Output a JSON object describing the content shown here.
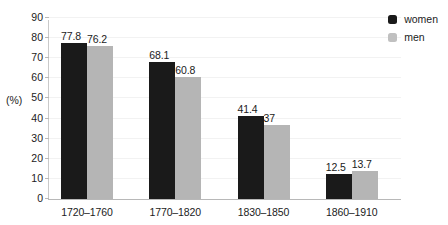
{
  "chart_data": {
    "type": "bar",
    "title": "",
    "subtitle": "",
    "xlabel": "",
    "ylabel": "(%)",
    "ylim": [
      0,
      90
    ],
    "yticks": [
      0,
      10,
      20,
      30,
      40,
      50,
      60,
      70,
      80,
      90
    ],
    "ytick_labels": [
      "0",
      "10",
      "20",
      "30",
      "40",
      "50",
      "60",
      "70",
      "80",
      "90"
    ],
    "grid": true,
    "legend_position": "top-right",
    "categories": [
      "1720–1760",
      "1770–1820",
      "1830–1850",
      "1860–1910"
    ],
    "series": [
      {
        "name": "women",
        "color": "#1a1a1a",
        "values": [
          77.8,
          68.1,
          41.4,
          12.5
        ],
        "labels": [
          "77.8",
          "68.1",
          "41.4",
          "12.5"
        ]
      },
      {
        "name": "men",
        "color": "#b5b5b5",
        "values": [
          76.2,
          60.8,
          37,
          13.7
        ],
        "labels": [
          "76.2",
          "60.8",
          "37",
          "13.7"
        ]
      }
    ]
  },
  "legend": {
    "items": [
      {
        "label": "women",
        "swatch": "women-swatch-icon"
      },
      {
        "label": "men",
        "swatch": "men-swatch-icon"
      }
    ]
  },
  "colors": {
    "women": "#1a1a1a",
    "men": "#b5b5b5",
    "gridline": "#f2f2f2",
    "axis": "#b8b8b8",
    "text": "#1b1b1b",
    "background": "#ffffff"
  }
}
